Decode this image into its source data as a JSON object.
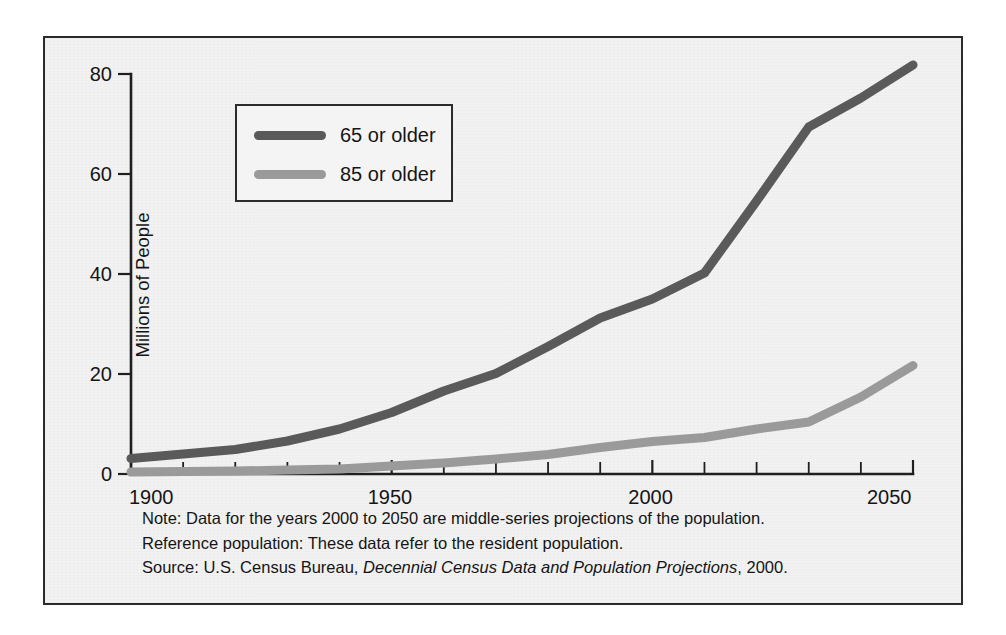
{
  "figure": {
    "background_color": "#f2f2f2",
    "frame_color": "#2b2b2b"
  },
  "legend": {
    "position": "top-left-inside",
    "entries": [
      {
        "label": "65 or older",
        "color": "#5a5a5a"
      },
      {
        "label": "85 or older",
        "color": "#9a9a9a"
      }
    ]
  },
  "notes": {
    "note_line": "Note:  Data for the years 2000 to 2050 are middle-series projections of the population.",
    "reference_line": "Reference population: These data refer to the resident population.",
    "source_prefix": "Source:  U.S. Census Bureau,",
    "source_italic": "Decennial Census Data and Population Projections",
    "source_suffix": ", 2000."
  },
  "chart_data": {
    "type": "line",
    "title": "",
    "xlabel": "",
    "ylabel": "Millions of People",
    "xlim": [
      1900,
      2050
    ],
    "ylim": [
      0,
      80
    ],
    "grid": false,
    "legend_position": "upper left",
    "x_ticks_major": [
      1900,
      1950,
      2000,
      2050
    ],
    "x_ticks_major_labels": [
      "1900",
      "1950",
      "2000",
      "2050"
    ],
    "x_ticks_minor": [
      1910,
      1920,
      1930,
      1940,
      1960,
      1970,
      1980,
      1990,
      2010,
      2020,
      2030,
      2040
    ],
    "y_ticks": [
      0,
      20,
      40,
      60,
      80
    ],
    "y_tick_labels": [
      "0",
      "20",
      "40",
      "60",
      "80"
    ],
    "x": [
      1900,
      1910,
      1920,
      1930,
      1940,
      1950,
      1960,
      1970,
      1980,
      1990,
      2000,
      2010,
      2020,
      2030,
      2040,
      2050
    ],
    "series": [
      {
        "name": "65 or older",
        "color": "#5a5a5a",
        "stroke_width": 9,
        "values": [
          3.1,
          4.0,
          4.9,
          6.6,
          9.0,
          12.3,
          16.6,
          20.1,
          25.5,
          31.2,
          35.0,
          40.2,
          54.6,
          69.4,
          75.2,
          81.8
        ]
      },
      {
        "name": "85 or older",
        "color": "#9a9a9a",
        "stroke_width": 9,
        "values": [
          0.4,
          0.5,
          0.6,
          0.8,
          1.0,
          1.6,
          2.2,
          3.0,
          3.9,
          5.3,
          6.5,
          7.3,
          9.0,
          10.4,
          15.4,
          21.7
        ]
      }
    ]
  }
}
